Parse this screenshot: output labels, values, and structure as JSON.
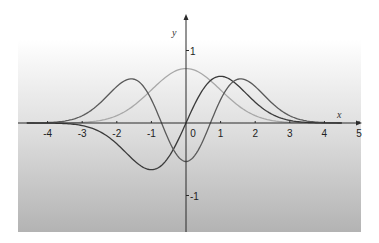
{
  "chart_data": {
    "type": "line",
    "title": "",
    "xlabel": "x",
    "ylabel": "y",
    "xlim": [
      -4.6,
      5
    ],
    "ylim": [
      -1.5,
      1.5
    ],
    "grid": false,
    "legend": null,
    "x_ticks": [
      -4,
      -3,
      -2,
      -1,
      0,
      1,
      2,
      3,
      4,
      5
    ],
    "x_tick_labels": [
      "-4",
      "-3",
      "-2",
      "-1",
      "0",
      "1",
      "2",
      "3",
      "4",
      "5"
    ],
    "y_ticks": [
      1,
      -1
    ],
    "y_tick_labels": [
      "1",
      "-1"
    ],
    "x": [
      -4.5,
      -4.25,
      -4.0,
      -3.75,
      -3.5,
      -3.25,
      -3.0,
      -2.75,
      -2.5,
      -2.25,
      -2.0,
      -1.75,
      -1.5,
      -1.25,
      -1.0,
      -0.75,
      -0.5,
      -0.25,
      0.0,
      0.25,
      0.5,
      0.75,
      1.0,
      1.25,
      1.5,
      1.75,
      2.0,
      2.25,
      2.5,
      2.75,
      3.0,
      3.25,
      3.5,
      3.75,
      4.0,
      4.25,
      4.5
    ],
    "series": [
      {
        "name": "psi0",
        "color": "#a8a8a8",
        "values": [
          0.0003,
          0.0009,
          0.0025,
          0.0067,
          0.0163,
          0.0381,
          0.0835,
          0.1691,
          0.329,
          0.5983,
          0.1017,
          0.162,
          0.2435,
          0.3455,
          0.4556,
          0.5692,
          0.6629,
          0.7279,
          0.7511,
          0.7279,
          0.6629,
          0.5692,
          0.4556,
          0.3455,
          0.2435,
          0.162,
          0.1017,
          0.0598,
          0.0329,
          0.0169,
          0.0084,
          0.0038,
          0.0016,
          0.0007,
          0.0003,
          0.0001,
          0.0
        ]
      },
      {
        "name": "psi1",
        "color": "#3a3a3a",
        "values": [
          -0.0021,
          -0.0057,
          -0.0143,
          -0.0356,
          -0.0807,
          -0.1751,
          -0.3541,
          -0.6574,
          -0.1163,
          -0.1903,
          -0.2876,
          -0.401,
          -0.5165,
          -0.6108,
          -0.6443,
          -0.6037,
          -0.4687,
          -0.2574,
          0.0,
          0.2574,
          0.4687,
          0.6037,
          0.6443,
          0.6108,
          0.5165,
          0.401,
          0.2876,
          0.1903,
          0.1163,
          0.0657,
          0.0354,
          0.0175,
          0.0081,
          0.0036,
          0.0014,
          0.0005,
          0.0002
        ]
      },
      {
        "name": "psi2",
        "color": "#5a5a5a",
        "values": [
          0.0071,
          0.0197,
          0.0516,
          0.1226,
          0.2541,
          0.4566,
          0.709,
          0.9347,
          0.1338,
          0.1823,
          0.2157,
          0.23,
          0.2325,
          0.2153,
          0.1855,
          0.1054,
          -0.1172,
          -0.4504,
          -0.5311,
          -0.4504,
          -0.2344,
          0.0503,
          0.3222,
          0.5227,
          0.6025,
          0.5585,
          0.5035,
          0.3752,
          0.2558,
          0.1605,
          0.0939,
          0.0541,
          0.0282,
          0.0134,
          0.0059,
          0.0024,
          0.0009
        ]
      }
    ]
  },
  "axes": {
    "x_label": "x",
    "y_label": "y"
  }
}
